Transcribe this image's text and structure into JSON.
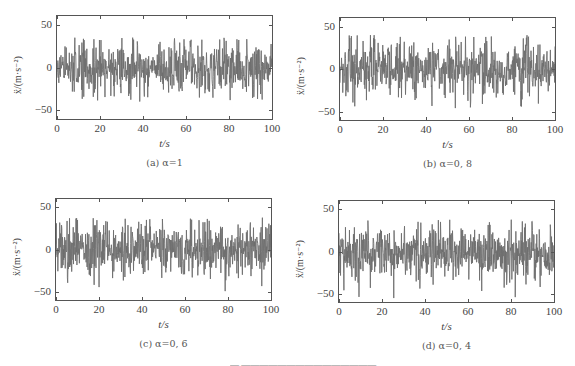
{
  "chart_data": [
    {
      "type": "line",
      "id": "a",
      "caption": "(a) α=1",
      "xlabel": "t/s",
      "ylabel": "ẍ/(m·s⁻²)",
      "xlim": [
        0,
        100
      ],
      "ylim": [
        -60,
        60
      ],
      "xticks": [
        0,
        20,
        40,
        60,
        80,
        100
      ],
      "yticks": [
        50,
        0,
        -50
      ],
      "series_description": "Random acceleration time history, amplitude mostly within ±25, peaks up to ~35 and down to ~-40",
      "amplitude": 14,
      "peak_max": 35,
      "peak_min": -40,
      "seed": 11,
      "color": "#6e6e6e",
      "frame": {
        "left": 56,
        "top": 15,
        "width": 217,
        "height": 105
      }
    },
    {
      "type": "line",
      "id": "b",
      "caption": "(b) α=0, 8",
      "xlabel": "t/s",
      "ylabel": "ẍ/(m·s⁻²)",
      "xlim": [
        0,
        100
      ],
      "ylim": [
        -60,
        60
      ],
      "xticks": [
        0,
        20,
        40,
        60,
        80,
        100
      ],
      "yticks": [
        50,
        0,
        -50
      ],
      "series_description": "Random acceleration time history, peaks ~40 near t=5 and t=35, minima ~-45",
      "amplitude": 14,
      "peak_max": 40,
      "peak_min": -46,
      "seed": 23,
      "color": "#6e6e6e",
      "frame": {
        "left": 339,
        "top": 17,
        "width": 217,
        "height": 104
      }
    },
    {
      "type": "line",
      "id": "c",
      "caption": "(c) α=0, 6",
      "xlabel": "t/s",
      "ylabel": "ẍ/(m·s⁻²)",
      "xlim": [
        0,
        100
      ],
      "ylim": [
        -60,
        60
      ],
      "xticks": [
        0,
        20,
        40,
        60,
        80,
        100
      ],
      "yticks": [
        50,
        0,
        -50
      ],
      "series_description": "Random acceleration time history, growing near t=98 up to ~38, minima ~-50",
      "amplitude": 14,
      "peak_max": 38,
      "peak_min": -50,
      "seed": 37,
      "color": "#6e6e6e",
      "frame": {
        "left": 55,
        "top": 198,
        "width": 217,
        "height": 103
      }
    },
    {
      "type": "line",
      "id": "d",
      "caption": "(d) α=0, 4",
      "xlabel": "t/s",
      "ylabel": "ẍ/(m·s⁻²)",
      "xlim": [
        0,
        100
      ],
      "ylim": [
        -60,
        60
      ],
      "xticks": [
        0,
        20,
        40,
        60,
        80,
        100
      ],
      "yticks": [
        50,
        0,
        -50
      ],
      "series_description": "Random acceleration time history, skewed negative, minima ~-58 near t=72, max ~38 near t=88",
      "amplitude": 15,
      "peak_max": 38,
      "peak_min": -58,
      "seed": 53,
      "color": "#6e6e6e",
      "frame": {
        "left": 338,
        "top": 200,
        "width": 217,
        "height": 103
      }
    }
  ],
  "figure_caption_partial": "图 … 的加速度时程"
}
